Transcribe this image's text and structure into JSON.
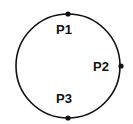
{
  "diagram": {
    "circle": {
      "cx": 68,
      "cy": 66,
      "r": 52,
      "stroke": "#111111",
      "stroke_width": 1.6
    },
    "points": [
      {
        "id": "P1",
        "label": "P1",
        "x": 68,
        "y": 14,
        "label_x": 56,
        "label_y": 34
      },
      {
        "id": "P2",
        "label": "P2",
        "x": 121,
        "y": 66,
        "label_x": 93,
        "label_y": 71
      },
      {
        "id": "P3",
        "label": "P3",
        "x": 68,
        "y": 118,
        "label_x": 56,
        "label_y": 103
      }
    ],
    "colors": {
      "line": "#111111",
      "point": "#111111",
      "background": "#ffffff"
    }
  }
}
